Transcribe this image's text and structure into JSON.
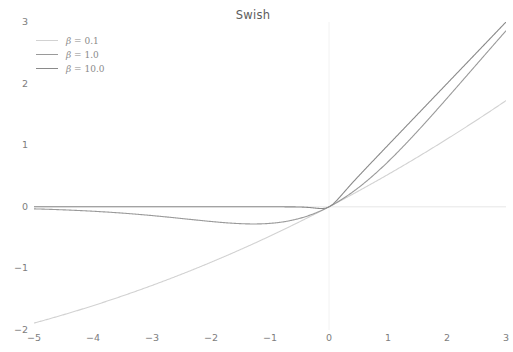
{
  "chart_data": {
    "type": "line",
    "title": "Swish",
    "xlabel": "",
    "ylabel": "",
    "xlim": [
      -5,
      3
    ],
    "ylim": [
      -2,
      3
    ],
    "xticks": [
      -5,
      -4,
      -3,
      -2,
      -1,
      0,
      1,
      2,
      3
    ],
    "xtick_labels": [
      "−5",
      "−4",
      "−3",
      "−2",
      "−1",
      "0",
      "1",
      "2",
      "3"
    ],
    "yticks": [
      -2,
      -1,
      0,
      1,
      2,
      3
    ],
    "ytick_labels": [
      "−2",
      "−1",
      "0",
      "1",
      "2",
      "3"
    ],
    "grid": false,
    "axis_lines": {
      "x_zero_line": true,
      "y_zero_line": true
    },
    "legend_position": "upper left",
    "series": [
      {
        "name": "β = 0.1",
        "beta": 0.1,
        "color": "#d2d2d2",
        "x": [
          -5,
          -4.5,
          -4,
          -3.5,
          -3,
          -2.5,
          -2,
          -1.5,
          -1,
          -0.5,
          0,
          0.5,
          1,
          1.5,
          2,
          2.5,
          3
        ],
        "values": [
          -1.876,
          -1.7232,
          -1.5601,
          -1.3873,
          -1.2058,
          -1.0163,
          -0.82,
          -0.618,
          -0.4125,
          -0.2063,
          0.0,
          0.2063,
          0.4125,
          0.618,
          0.82,
          1.0163,
          1.2058
        ]
      },
      {
        "name": "β = 1.0",
        "beta": 1.0,
        "color": "#9a9a9a",
        "x": [
          -5,
          -4.5,
          -4,
          -3.5,
          -3,
          -2.5,
          -2,
          -1.5,
          -1,
          -0.5,
          0,
          0.5,
          1,
          1.5,
          2,
          2.5,
          3
        ],
        "values": [
          -0.0335,
          -0.0494,
          -0.0719,
          -0.1035,
          -0.1423,
          -0.1908,
          -0.2384,
          -0.26,
          -0.2689,
          -0.1888,
          0.0,
          0.3112,
          0.7311,
          1.26,
          1.7616,
          2.3092,
          2.8577
        ]
      },
      {
        "name": "β = 10.0",
        "beta": 10.0,
        "color": "#8a8a8a",
        "x": [
          -5,
          -4.5,
          -4,
          -3.5,
          -3,
          -2.5,
          -2,
          -1.5,
          -1,
          -0.5,
          -0.25,
          -0.1,
          0,
          0.5,
          1,
          1.5,
          2,
          2.5,
          3
        ],
        "values": [
          0.0,
          0.0,
          0.0,
          0.0,
          0.0,
          0.0,
          0.0,
          0.0,
          -5e-05,
          -0.0034,
          -0.0205,
          -0.0269,
          0.0,
          0.4966,
          1.0,
          1.5,
          2.0,
          2.5,
          3.0
        ]
      }
    ]
  },
  "axes": {
    "y_labels": [
      "3",
      "2",
      "1",
      "0",
      "−1",
      "−2"
    ],
    "x_labels": [
      "−5",
      "−4",
      "−3",
      "−2",
      "−1",
      "0",
      "1",
      "2",
      "3"
    ]
  },
  "legend": {
    "items": [
      {
        "beta_symbol": "β",
        "equals_value": "= 0.1",
        "full": "β = 0.1",
        "color": "#d2d2d2"
      },
      {
        "beta_symbol": "β",
        "equals_value": "= 1.0",
        "full": "β = 1.0",
        "color": "#9a9a9a"
      },
      {
        "beta_symbol": "β",
        "equals_value": "= 10.0",
        "full": "β = 10.0",
        "color": "#8a8a8a"
      }
    ]
  },
  "style": {
    "background": "#ffffff",
    "axis_line_color": "#e0e0e0",
    "tick_color": "#7d7d7d",
    "title_color": "#5c5c5c"
  }
}
